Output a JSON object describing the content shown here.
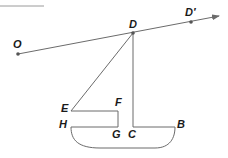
{
  "colors": {
    "line": "#6b6b6b",
    "point": "#555555",
    "label": "#1a1a1a",
    "background": "#ffffff"
  },
  "labels": {
    "O": "O",
    "D": "D",
    "D_prime": "D′",
    "E": "E",
    "F": "F",
    "H": "H",
    "G": "G",
    "C": "C",
    "B": "B"
  },
  "points": {
    "O": [
      18,
      54
    ],
    "D": [
      133,
      33
    ],
    "D_prime": [
      191,
      22
    ],
    "E": [
      71,
      111
    ],
    "F": [
      118,
      111
    ],
    "H": [
      71,
      127
    ],
    "G": [
      118,
      127
    ],
    "C": [
      133,
      127
    ],
    "B": [
      175,
      127
    ]
  }
}
